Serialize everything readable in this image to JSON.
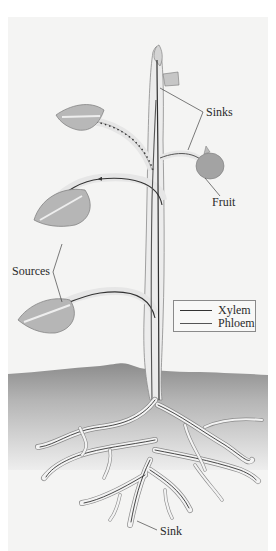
{
  "figure": {
    "type": "plant source-sink transport diagram",
    "labels": {
      "sinks": "Sinks",
      "fruit": "Fruit",
      "sources": "Sources",
      "sink": "Sink"
    },
    "legend": {
      "items": [
        {
          "label": "Xylem"
        },
        {
          "label": "Phloem"
        }
      ]
    },
    "colors": {
      "background": "#f4f4f3",
      "soil_top": "#8f8f8f",
      "soil_bottom": "#e6e6e6",
      "leaf": "#b4b4b4",
      "stem": "#eaeaea",
      "vessel": "#3a3a3a",
      "fruit": "#9a9a9a"
    }
  }
}
